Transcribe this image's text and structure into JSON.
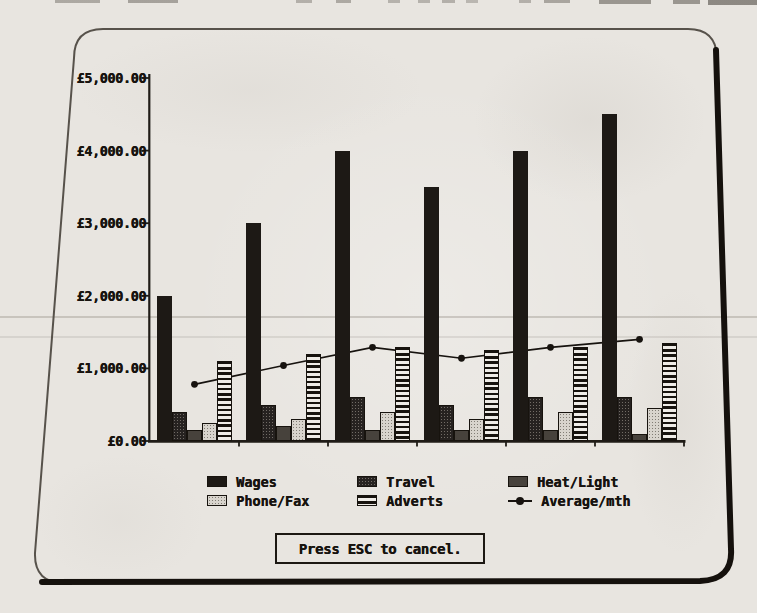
{
  "page": {
    "esc_box": {
      "label": "Press ESC to cancel."
    }
  },
  "chart_data": {
    "type": "bar",
    "title": "",
    "currency": "£",
    "y_tick_labels": [
      "£5,000.00",
      "£4,000.00",
      "£3,000.00",
      "£2,000.00",
      "£1,000.00",
      "£0.00"
    ],
    "y_tick_values": [
      5000,
      4000,
      3000,
      2000,
      1000,
      0
    ],
    "ylim": [
      0,
      5000
    ],
    "x_groups": 6,
    "x_tick_labels": [],
    "grid": false,
    "legend_position": "bottom",
    "series": [
      {
        "name": "Wages",
        "pattern": "wages",
        "values": [
          2000,
          3000,
          4000,
          3500,
          4000,
          4500
        ]
      },
      {
        "name": "Travel",
        "pattern": "travel",
        "values": [
          400,
          500,
          600,
          500,
          600,
          600
        ]
      },
      {
        "name": "Heat/Light",
        "pattern": "heatlight",
        "values": [
          150,
          200,
          150,
          150,
          150,
          100
        ]
      },
      {
        "name": "Phone/Fax",
        "pattern": "phonefax",
        "values": [
          250,
          300,
          400,
          300,
          400,
          450
        ]
      },
      {
        "name": "Adverts",
        "pattern": "adverts",
        "values": [
          1100,
          1200,
          1300,
          1250,
          1300,
          1350
        ]
      }
    ],
    "line_series": [
      {
        "name": "Average/mth",
        "pattern": "line",
        "values": [
          780,
          1040,
          1290,
          1140,
          1290,
          1400
        ]
      }
    ],
    "legend": [
      {
        "label": "Wages",
        "pattern": "wages"
      },
      {
        "label": "Travel",
        "pattern": "travel"
      },
      {
        "label": "Heat/Light",
        "pattern": "heatlight"
      },
      {
        "label": "Phone/Fax",
        "pattern": "phonefax"
      },
      {
        "label": "Adverts",
        "pattern": "adverts"
      },
      {
        "label": "Average/mth",
        "pattern": "line"
      }
    ],
    "ink_color": "#17130f",
    "paper_color": "#e8e5e0"
  }
}
